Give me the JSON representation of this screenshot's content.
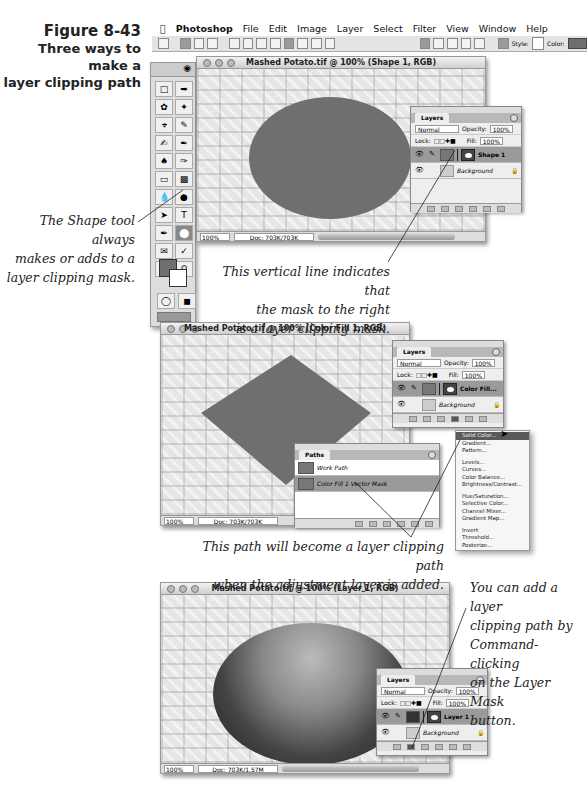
{
  "figure": {
    "number": "Figure 8-43",
    "caption_line1": "Three ways to make a",
    "caption_line2": "layer clipping path"
  },
  "menubar": {
    "apple_icon": "apple-icon",
    "items": [
      "Photoshop",
      "File",
      "Edit",
      "Image",
      "Layer",
      "Select",
      "Filter",
      "View",
      "Window",
      "Help"
    ]
  },
  "options_bar": {
    "style_label": "Style:",
    "color_label": "Color:",
    "color_value": "#6f6f6f"
  },
  "windows": [
    {
      "title": "Mashed Potato.tif @ 100% (Shape 1, RGB)",
      "zoom": "100%",
      "doc": "Doc: 703K/703K",
      "shape": "ellipse",
      "shape_color": "#6f6f6f",
      "layers_panel": {
        "tab": "Layers",
        "blend_mode": "Normal",
        "opacity_label": "Opacity:",
        "opacity": "100%",
        "lock_label": "Lock:",
        "fill_label": "Fill:",
        "fill": "100%",
        "layers": [
          {
            "name": "Shape 1",
            "active": true
          },
          {
            "name": "Background",
            "active": false
          }
        ]
      }
    },
    {
      "title": "Mashed Potato.tif @ 100% (Color Fill 1, RGB)",
      "zoom": "100%",
      "doc": "Doc: 703K/703K",
      "shape": "diamond",
      "shape_color": "#6f6f6f",
      "layers_panel": {
        "tab": "Layers",
        "blend_mode": "Normal",
        "opacity_label": "Opacity:",
        "opacity": "100%",
        "lock_label": "Lock:",
        "fill_label": "Fill:",
        "fill": "100%",
        "layers": [
          {
            "name": "Color Fill...",
            "active": true
          },
          {
            "name": "Background",
            "active": false
          }
        ]
      },
      "paths_panel": {
        "tab": "Paths",
        "paths": [
          {
            "name": "Work Path",
            "active": false
          },
          {
            "name": "Color Fill 1 Vector Mask",
            "active": true
          }
        ]
      },
      "adjustment_menu": [
        "Solid Color...",
        "Gradient...",
        "Pattern...",
        "",
        "Levels...",
        "Curves...",
        "Color Balance...",
        "Brightness/Contrast...",
        "",
        "Hue/Saturation...",
        "Selective Color...",
        "Channel Mixer...",
        "Gradient Map...",
        "",
        "Invert",
        "Threshold...",
        "Posterize..."
      ]
    },
    {
      "title": "Mashed Potato.tif @ 100% (Layer 1, RGB)",
      "zoom": "100%",
      "doc": "Doc: 703K/1.57M",
      "layers_panel": {
        "tab": "Layers",
        "blend_mode": "Normal",
        "opacity_label": "Opacity:",
        "opacity": "100%",
        "lock_label": "Lock:",
        "fill_label": "Fill:",
        "fill": "100%",
        "layers": [
          {
            "name": "Layer 1",
            "active": true
          },
          {
            "name": "Background",
            "active": false
          }
        ]
      }
    }
  ],
  "callouts": {
    "shape_tool": [
      "The Shape tool always",
      "makes or adds to a",
      "layer clipping mask."
    ],
    "vertical_line": [
      "This vertical line indicates that",
      "the mask to the right",
      "is a layer clipping mask."
    ],
    "path": [
      "This path will become a layer clipping path",
      "when the adjustment layer is added."
    ],
    "command_click": [
      "You can add a layer",
      "clipping path by",
      "Command-clicking",
      "on the Layer Mask",
      "button."
    ]
  }
}
